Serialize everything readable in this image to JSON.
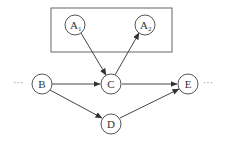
{
  "diagram": {
    "type": "directed-graph",
    "group": {
      "label": "",
      "members": [
        "A1",
        "A2"
      ]
    },
    "nodes": [
      {
        "id": "A1",
        "label": "A",
        "subscript": "1",
        "x": 75,
        "y": 25
      },
      {
        "id": "A2",
        "label": "A",
        "subscript": "2",
        "x": 145,
        "y": 25
      },
      {
        "id": "B",
        "label": "B",
        "subscript": "",
        "x": 42,
        "y": 84
      },
      {
        "id": "C",
        "label": "C",
        "subscript": "",
        "x": 111,
        "y": 84
      },
      {
        "id": "D",
        "label": "D",
        "subscript": "",
        "x": 111,
        "y": 124
      },
      {
        "id": "E",
        "label": "E",
        "subscript": "",
        "x": 188,
        "y": 84
      }
    ],
    "edges": [
      {
        "from": "A1",
        "to": "C"
      },
      {
        "from": "C",
        "to": "A2"
      },
      {
        "from": "B",
        "to": "C"
      },
      {
        "from": "B",
        "to": "D"
      },
      {
        "from": "C",
        "to": "E"
      },
      {
        "from": "D",
        "to": "E"
      }
    ],
    "ellipsis_left": "···",
    "ellipsis_right": "···"
  }
}
